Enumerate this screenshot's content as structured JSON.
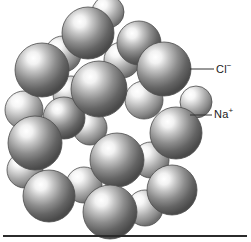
{
  "figure": {
    "background_color": "#ffffff"
  },
  "labels": {
    "chloride": {
      "text": "Cl",
      "charge": "−",
      "full": "Cl−"
    },
    "sodium": {
      "text": "Na",
      "charge": "+",
      "full": "Na+"
    }
  },
  "legend_colors": {
    "chloride_base": "#6e6e6e",
    "chloride_dark": "#4a4a4a",
    "sodium_base": "#9a9a9a",
    "sodium_dark": "#6a6a6a",
    "highlight": "#ffffff",
    "outline": "#4d4d4d",
    "rule": "#2b2b2b",
    "text": "#1a1a1a"
  },
  "leader_lines": {
    "chloride": {
      "x1": 190,
      "y1": 69,
      "x2": 214,
      "y2": 69
    },
    "sodium": {
      "x1": 190,
      "y1": 115,
      "x2": 212,
      "y2": 115
    }
  },
  "chart_data": {
    "type": "scatter",
    "xlabel": "",
    "ylabel": "",
    "legend": [
      "Cl−",
      "Na+"
    ],
    "series": [
      {
        "name": "Cl−",
        "radius": 26,
        "spheres": [
          {
            "cx": 88,
            "cy": 33,
            "r": 26,
            "z": 9
          },
          {
            "cx": 42,
            "cy": 70,
            "r": 27,
            "z": 10
          },
          {
            "cx": 99,
            "cy": 89,
            "r": 28,
            "z": 14
          },
          {
            "cx": 164,
            "cy": 69,
            "r": 27,
            "z": 8
          },
          {
            "cx": 35,
            "cy": 143,
            "r": 27,
            "z": 12
          },
          {
            "cx": 117,
            "cy": 160,
            "r": 27,
            "z": 13
          },
          {
            "cx": 176,
            "cy": 133,
            "r": 26,
            "z": 7
          },
          {
            "cx": 49,
            "cy": 196,
            "r": 26,
            "z": 11
          },
          {
            "cx": 110,
            "cy": 212,
            "r": 27,
            "z": 15
          },
          {
            "cx": 172,
            "cy": 190,
            "r": 25,
            "z": 6
          },
          {
            "cx": 139,
            "cy": 43,
            "r": 22,
            "z": 4
          },
          {
            "cx": 64,
            "cy": 118,
            "r": 21,
            "z": 5
          }
        ]
      },
      {
        "name": "Na+",
        "radius": 18,
        "spheres": [
          {
            "cx": 63,
            "cy": 54,
            "r": 18,
            "z": 3
          },
          {
            "cx": 122,
            "cy": 60,
            "r": 18,
            "z": 3
          },
          {
            "cx": 71,
            "cy": 94,
            "r": 18,
            "z": 2
          },
          {
            "cx": 144,
            "cy": 100,
            "r": 19,
            "z": 3
          },
          {
            "cx": 24,
            "cy": 110,
            "r": 19,
            "z": 3
          },
          {
            "cx": 90,
            "cy": 128,
            "r": 17,
            "z": 2
          },
          {
            "cx": 151,
            "cy": 160,
            "r": 18,
            "z": 2
          },
          {
            "cx": 84,
            "cy": 185,
            "r": 18,
            "z": 2
          },
          {
            "cx": 25,
            "cy": 170,
            "r": 18,
            "z": 2
          },
          {
            "cx": 145,
            "cy": 208,
            "r": 18,
            "z": 2
          },
          {
            "cx": 108,
            "cy": 12,
            "r": 16,
            "z": 1
          },
          {
            "cx": 196,
            "cy": 102,
            "r": 16,
            "z": 1
          }
        ]
      }
    ]
  }
}
